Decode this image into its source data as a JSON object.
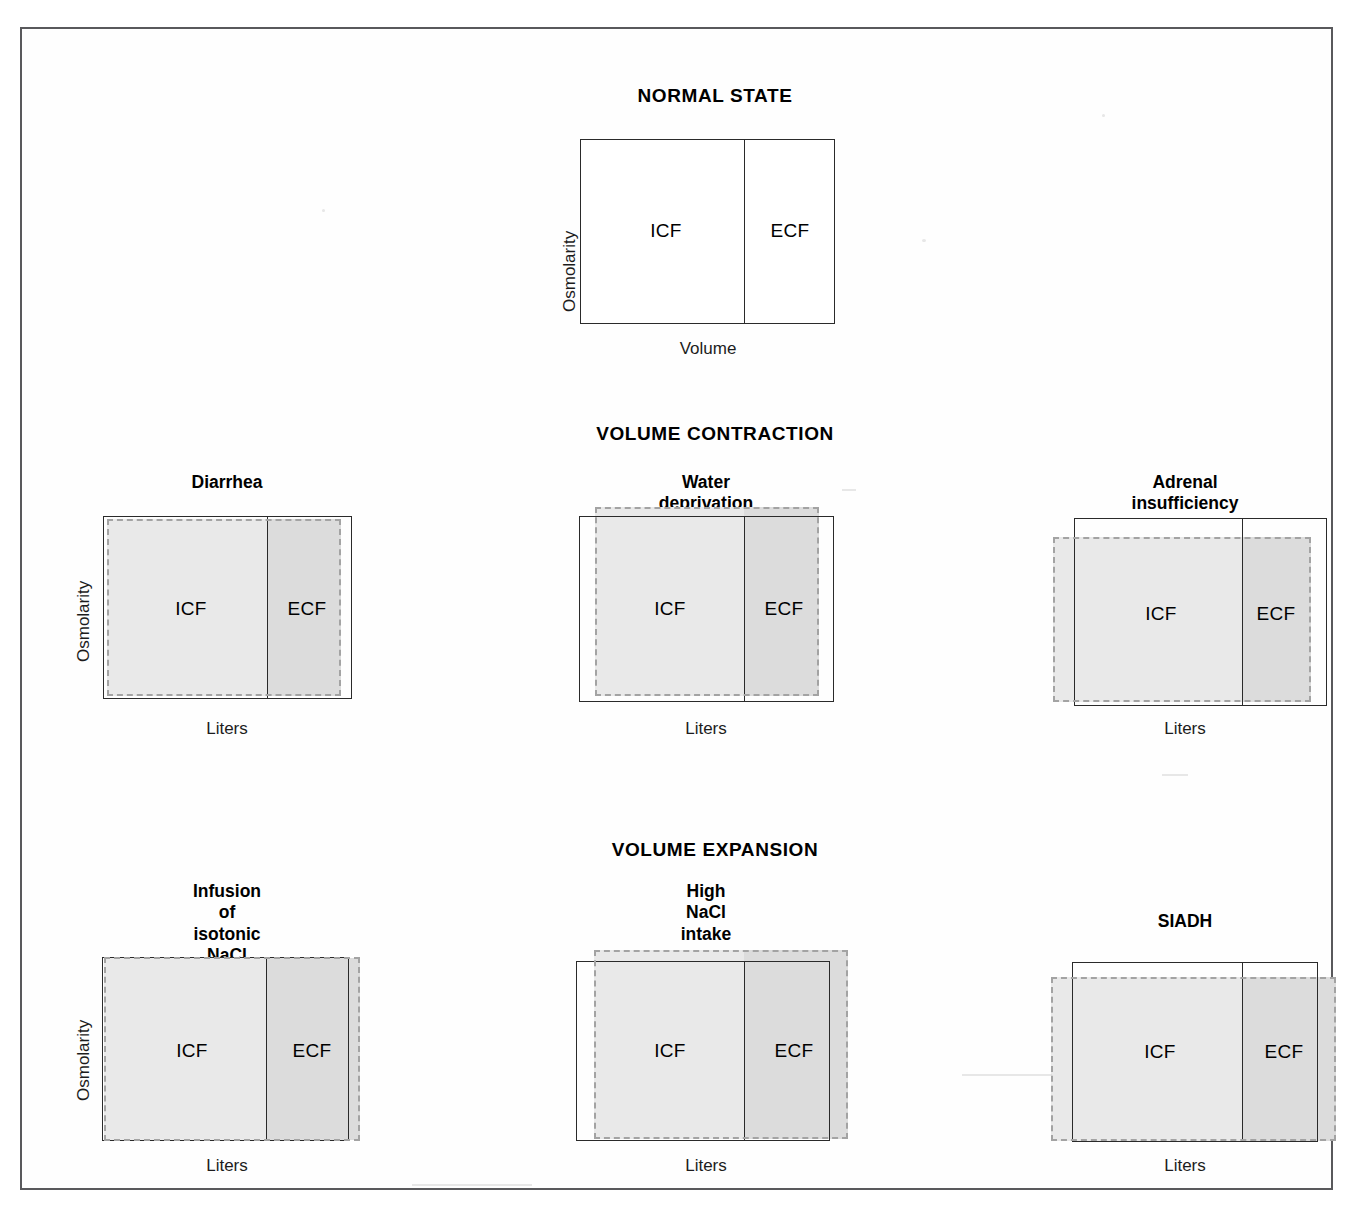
{
  "figure": {
    "type": "darrow-yannet-diagram-set",
    "compartment_labels": {
      "icf": "ICF",
      "ecf": "ECF"
    },
    "axis": {
      "y_label": "Osmolarity",
      "x_label_normal": "Volume",
      "x_label_panels": "Liters"
    },
    "colors": {
      "solid_outline": "#2a2a2a",
      "dashed_outline": "#a3a3a3",
      "icf_fill": "#e9e9e9",
      "ecf_fill": "#dcdcdc",
      "frame": "#59595c",
      "background": "#ffffff"
    }
  },
  "sections": [
    {
      "id": "normal",
      "heading": "NORMAL STATE",
      "panels": [
        {
          "id": "normal-state",
          "title": "",
          "x_label": "Volume",
          "y_label": "Osmolarity",
          "icf": "ICF",
          "ecf": "ECF",
          "state": {
            "osmolarity_change": "none",
            "icf_volume_change": "none",
            "ecf_volume_change": "none",
            "has_dashed_overlay": false
          }
        }
      ]
    },
    {
      "id": "contraction",
      "heading": "VOLUME CONTRACTION",
      "panels": [
        {
          "id": "diarrhea",
          "title": "Diarrhea",
          "x_label": "Liters",
          "y_label": "Osmolarity",
          "icf": "ICF",
          "ecf": "ECF",
          "state": {
            "osmolarity_change": "none",
            "icf_volume_change": "none",
            "ecf_volume_change": "decrease",
            "has_dashed_overlay": true
          }
        },
        {
          "id": "water-deprivation",
          "title": "Water deprivation",
          "x_label": "Liters",
          "y_label": "",
          "icf": "ICF",
          "ecf": "ECF",
          "state": {
            "osmolarity_change": "increase",
            "icf_volume_change": "decrease",
            "ecf_volume_change": "decrease",
            "has_dashed_overlay": true
          }
        },
        {
          "id": "adrenal-insufficiency",
          "title": "Adrenal insufficiency",
          "x_label": "Liters",
          "y_label": "",
          "icf": "ICF",
          "ecf": "ECF",
          "state": {
            "osmolarity_change": "decrease",
            "icf_volume_change": "increase",
            "ecf_volume_change": "decrease",
            "has_dashed_overlay": true
          }
        }
      ]
    },
    {
      "id": "expansion",
      "heading": "VOLUME EXPANSION",
      "panels": [
        {
          "id": "isotonic-nacl",
          "title": "Infusion of\nisotonic NaCl",
          "x_label": "Liters",
          "y_label": "Osmolarity",
          "icf": "ICF",
          "ecf": "ECF",
          "state": {
            "osmolarity_change": "none",
            "icf_volume_change": "none",
            "ecf_volume_change": "increase",
            "has_dashed_overlay": true
          }
        },
        {
          "id": "high-nacl-intake",
          "title": "High\nNaCl intake",
          "x_label": "Liters",
          "y_label": "",
          "icf": "ICF",
          "ecf": "ECF",
          "state": {
            "osmolarity_change": "increase",
            "icf_volume_change": "decrease",
            "ecf_volume_change": "increase",
            "has_dashed_overlay": true
          }
        },
        {
          "id": "siadh",
          "title": "SIADH",
          "x_label": "Liters",
          "y_label": "",
          "icf": "ICF",
          "ecf": "ECF",
          "state": {
            "osmolarity_change": "decrease",
            "icf_volume_change": "increase",
            "ecf_volume_change": "increase",
            "has_dashed_overlay": true
          }
        }
      ]
    }
  ]
}
